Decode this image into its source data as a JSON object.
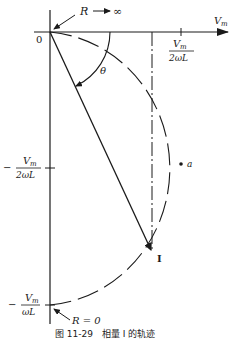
{
  "figure": {
    "caption": "图 11-29　相量 I 的轨迹",
    "axes": {
      "x_axis_label": "V",
      "x_axis_label_sub": "m",
      "origin_label": "0",
      "x_tick_label": {
        "num": "V",
        "num_sub": "m",
        "den": "2ωL"
      },
      "y_tick_half": {
        "sign": "−",
        "num": "V",
        "num_sub": "m",
        "den": "2ωL"
      },
      "y_tick_full": {
        "sign": "−",
        "num": "V",
        "num_sub": "m",
        "den": "ωL"
      }
    },
    "annotations": {
      "r_infinity": {
        "r": "R",
        "arrow": "→",
        "value": "∞"
      },
      "r_zero": "R = 0",
      "theta": "θ",
      "point_a": "a",
      "phasor_label": "I"
    },
    "colors": {
      "ink": "#1a1a1a",
      "background": "#ffffff"
    }
  }
}
